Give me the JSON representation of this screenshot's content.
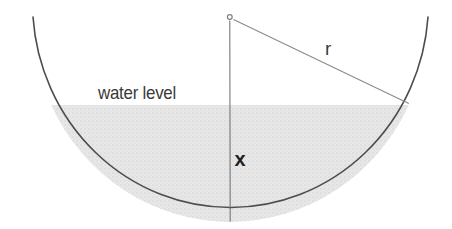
{
  "figure": {
    "labels": {
      "water_level": "water level",
      "radius": "r",
      "depth": "x"
    },
    "colors": {
      "background": "#ffffff",
      "water_fill": "#e7e7e7",
      "bowl_stroke": "#4d4d4d",
      "depth_line": "#6b6b6b",
      "radius_line": "#8a8a8a",
      "marker_stroke": "#808080",
      "marker_fill": "#ffffff",
      "label_text": "#3a3a3a",
      "depth_label_text": "#1f1f1f"
    }
  }
}
